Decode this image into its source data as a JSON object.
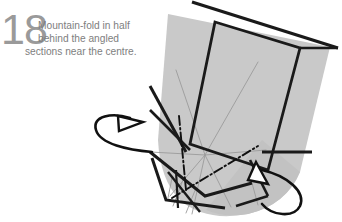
{
  "page": {
    "width": 342,
    "height": 222,
    "background_color": "#ffffff"
  },
  "instruction": {
    "step_number": "18",
    "step_number_color": "#9a9a9a",
    "text_color": "#7e7e7e",
    "lines": [
      "Mountain-fold in half",
      "behind the angled",
      "sections near the centre."
    ],
    "full_text": "Mountain-fold in half behind the angled sections near the centre."
  },
  "diagram": {
    "paper_fill": "#c9c9c9",
    "paper_fill_shadow": "#bfbfbf",
    "outline_color": "#1a1a1a",
    "crease_line_color": "#9b9b9b",
    "fold_line_color": "#111111",
    "arrow_color": "#111111",
    "fold_type": "mountain-fold",
    "arrow_count": 2,
    "arrows": [
      {
        "name": "mountain-fold-arrow-left",
        "style": "hollow-arrowhead-loop-behind"
      },
      {
        "name": "mountain-fold-arrow-right",
        "style": "hollow-arrowhead-loop-behind"
      }
    ],
    "crease_notation": {
      "mountain": "dash-dot",
      "existing_crease": "thin-solid-gray",
      "edge": "thick-solid-black"
    }
  }
}
